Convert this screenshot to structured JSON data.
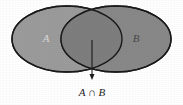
{
  "figure": {
    "type": "venn-diagram",
    "description_kind": "set-intersection",
    "background_color": "#ffffff",
    "sets": [
      {
        "name": "A",
        "label": "A",
        "fill_color": "#9b9b9b",
        "stroke_color": "#1a1a1a",
        "label_color": "#d9d9d9",
        "center_x": 67,
        "center_y": 39,
        "radius_x": 55,
        "radius_y": 33,
        "label_x": 46,
        "label_y": 42
      },
      {
        "name": "B",
        "label": "B",
        "fill_color": "#888888",
        "stroke_color": "#1a1a1a",
        "label_color": "#4a4a4a",
        "center_x": 116,
        "center_y": 39,
        "radius_x": 55,
        "radius_y": 33,
        "label_x": 136,
        "label_y": 42
      }
    ],
    "intersection": {
      "label": "A ∩ B",
      "fill_color": "#7e7e7e",
      "caption_x": 92,
      "caption_y": 96,
      "arrow": {
        "from_x": 92,
        "from_y": 40,
        "to_x": 92,
        "to_y": 80,
        "color": "#1a1a1a",
        "head_width": 5,
        "head_length": 6
      }
    },
    "stroke_width": 1.4
  }
}
